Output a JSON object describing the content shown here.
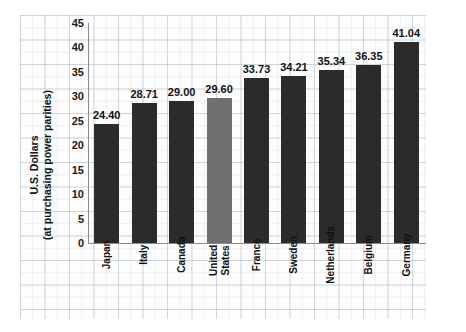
{
  "chart_data": {
    "type": "bar",
    "title": "",
    "xlabel": "",
    "ylabel_line1": "U.S. Dollars",
    "ylabel_line2": "(at purchasing power parities)",
    "ylim": [
      0,
      45
    ],
    "yticks": [
      45,
      40,
      35,
      30,
      25,
      20,
      15,
      10,
      5,
      0
    ],
    "grid": true,
    "legend": "none",
    "categories": [
      "Japan",
      "Italy",
      "Canada",
      "United States",
      "France",
      "Sweden",
      "Netherlands",
      "Belgium",
      "Germany"
    ],
    "values": [
      24.4,
      28.71,
      29.0,
      29.6,
      33.73,
      34.21,
      35.34,
      36.35,
      41.04
    ],
    "value_labels": [
      "24.40",
      "28.71",
      "29.00",
      "29.60",
      "33.73",
      "34.21",
      "35.34",
      "36.35",
      "41.04"
    ],
    "highlight_index": 3,
    "bar_color": "#2b2b2b",
    "highlight_color": "#6f6f6f"
  },
  "source": {
    "text": "SOURCE: U.S. Department of Labor, Bureau of Labor Statistics, Division of Foreign Labor Statistics, http://www.bls.gov."
  }
}
